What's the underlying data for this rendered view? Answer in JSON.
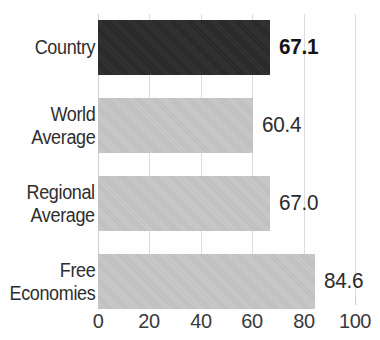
{
  "chart_data": {
    "type": "bar",
    "orientation": "horizontal",
    "title": "",
    "subtitle": "",
    "xlabel": "",
    "ylabel": "",
    "xlim": [
      0,
      100
    ],
    "xticks": [
      0,
      20,
      40,
      60,
      80,
      100
    ],
    "xtick_labels": [
      "0",
      "20",
      "40",
      "60",
      "80",
      "100"
    ],
    "grid": true,
    "legend": false,
    "categories": [
      "Country",
      "World Average",
      "Regional Average",
      "Free Economies"
    ],
    "values": [
      67.1,
      60.4,
      67.0,
      84.6
    ],
    "value_labels": [
      "67.1",
      "60.4",
      "67.0",
      "84.6"
    ],
    "highlight_index": 0,
    "colors": {
      "highlight_bar": "#262626",
      "bar": "#bdbdbd",
      "gridline": "#dcdcdc",
      "value_text": "#2b2b2b",
      "category_text": "#2e2e2e",
      "tick_text": "#3a3a3a",
      "background": "#fefefe"
    },
    "bars": [
      {
        "category": "Country",
        "label_lines": [
          "Country"
        ],
        "value": 67.1,
        "value_label": "67.1",
        "highlight": true,
        "bold_value": true
      },
      {
        "category": "World Average",
        "label_lines": [
          "World",
          "Average"
        ],
        "value": 60.4,
        "value_label": "60.4",
        "highlight": false,
        "bold_value": false
      },
      {
        "category": "Regional Average",
        "label_lines": [
          "Regional",
          "Average"
        ],
        "value": 67.0,
        "value_label": "67.0",
        "highlight": false,
        "bold_value": false
      },
      {
        "category": "Free Economies",
        "label_lines": [
          "Free",
          "Economies"
        ],
        "value": 84.6,
        "value_label": "84.6",
        "highlight": false,
        "bold_value": false
      }
    ]
  }
}
